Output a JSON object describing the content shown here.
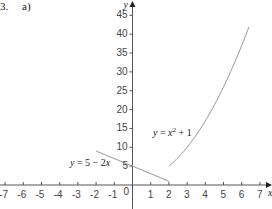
{
  "question": {
    "number": "3.",
    "part": "a)"
  },
  "chart_data": {
    "type": "line",
    "title": "",
    "xlabel": "x",
    "ylabel": "y",
    "xlim": [
      -7,
      7.4
    ],
    "ylim": [
      -2,
      48
    ],
    "x_ticks": [
      -7,
      -6,
      -5,
      -4,
      -3,
      -2,
      -1,
      1,
      2,
      3,
      4,
      5,
      6,
      7
    ],
    "y_ticks": [
      5,
      10,
      15,
      20,
      25,
      30,
      35,
      40,
      45
    ],
    "origin_label": "0",
    "grid": false,
    "series": [
      {
        "name": "y = 5 - 2x",
        "domain": [
          -2,
          2
        ],
        "points": [
          [
            -2,
            9
          ],
          [
            2,
            1
          ]
        ],
        "color": "#999999"
      },
      {
        "name": "y = x^2 + 1",
        "domain": [
          2,
          6.4
        ],
        "points": [
          [
            2,
            5
          ],
          [
            2.5,
            7.25
          ],
          [
            3,
            10
          ],
          [
            3.5,
            13.25
          ],
          [
            4,
            17
          ],
          [
            4.5,
            21.25
          ],
          [
            5,
            26
          ],
          [
            5.5,
            31.25
          ],
          [
            6,
            37
          ],
          [
            6.4,
            41.96
          ]
        ],
        "color": "#999999"
      }
    ],
    "annotations": [
      {
        "text": "y = 5 − 2x",
        "near": [
          -2.5,
          7
        ]
      },
      {
        "text": "y = x² + 1",
        "near": [
          2.5,
          15
        ]
      }
    ]
  }
}
